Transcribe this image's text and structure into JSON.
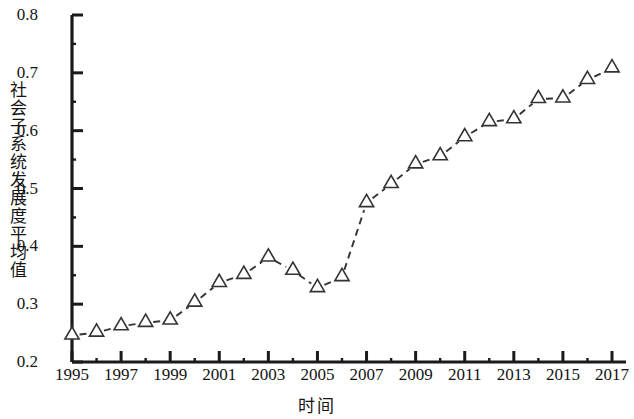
{
  "chart_data": {
    "type": "line",
    "title": "",
    "subtitle": "",
    "xlabel": "时间",
    "ylabel": "社会子系统发展度平均值",
    "xlim": [
      1995,
      2017
    ],
    "ylim": [
      0.2,
      0.8
    ],
    "y_major_step": 0.1,
    "y_minor_step": 0.05,
    "x_major_step": 2,
    "x_minor_step": 1,
    "grid": false,
    "legend": null,
    "marker": "open-triangle",
    "line_style": "dashed",
    "line_color": "#333333",
    "marker_edge_color": "#333333",
    "marker_face_color": "#ffffff",
    "x": [
      1995,
      1996,
      1997,
      1998,
      1999,
      2000,
      2001,
      2002,
      2003,
      2004,
      2005,
      2006,
      2007,
      2008,
      2009,
      2010,
      2011,
      2012,
      2013,
      2014,
      2015,
      2016,
      2017
    ],
    "values": [
      0.246,
      0.251,
      0.262,
      0.268,
      0.272,
      0.303,
      0.337,
      0.351,
      0.381,
      0.358,
      0.328,
      0.347,
      0.475,
      0.508,
      0.542,
      0.556,
      0.589,
      0.615,
      0.62,
      0.655,
      0.656,
      0.688,
      0.708
    ],
    "ytick_labels": [
      "0.2",
      "0.3",
      "0.4",
      "0.5",
      "0.6",
      "0.7",
      "0.8"
    ],
    "ytick_values": [
      0.2,
      0.3,
      0.4,
      0.5,
      0.6,
      0.7,
      0.8
    ],
    "xtick_labels": [
      "1995",
      "1997",
      "1999",
      "2001",
      "2003",
      "2005",
      "2007",
      "2009",
      "2011",
      "2013",
      "2015",
      "2017"
    ],
    "xtick_values": [
      1995,
      1997,
      1999,
      2001,
      2003,
      2005,
      2007,
      2009,
      2011,
      2013,
      2015,
      2017
    ]
  }
}
